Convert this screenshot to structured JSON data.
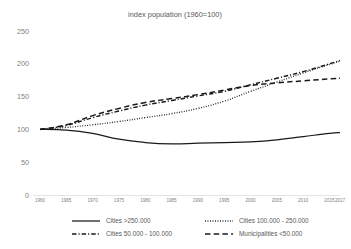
{
  "chart_data": {
    "type": "line",
    "title": "index population (1960=100)",
    "xlabel": "",
    "ylabel": "",
    "ylim": [
      0,
      250
    ],
    "yticks": [
      0,
      50,
      100,
      150,
      200,
      250
    ],
    "xlim": [
      1960,
      2017
    ],
    "xticks": [
      1960,
      1965,
      1970,
      1975,
      1980,
      1985,
      1990,
      1995,
      2000,
      2005,
      2010,
      2015,
      2017
    ],
    "grid": false,
    "legend_position": "bottom",
    "x": [
      1960,
      1965,
      1970,
      1975,
      1980,
      1985,
      1990,
      1995,
      2000,
      2005,
      2010,
      2015,
      2017
    ],
    "series": [
      {
        "name": "Cities >250.000",
        "style": "solid",
        "color": "#1a1a1a",
        "values": [
          100,
          99,
          94,
          85,
          80,
          78,
          79,
          80,
          81,
          84,
          89,
          94,
          95
        ]
      },
      {
        "name": "Cities 100.000 - 250.000",
        "style": "dotted",
        "color": "#1a1a1a",
        "values": [
          100,
          103,
          107,
          112,
          118,
          124,
          132,
          143,
          158,
          172,
          186,
          199,
          204
        ]
      },
      {
        "name": "Cities 50.000 - 100.000",
        "style": "dash-dot",
        "color": "#1a1a1a",
        "values": [
          100,
          106,
          118,
          128,
          137,
          144,
          151,
          158,
          168,
          178,
          188,
          200,
          205
        ]
      },
      {
        "name": "Municipalities <50.000",
        "style": "dashed",
        "color": "#1a1a1a",
        "values": [
          100,
          107,
          121,
          132,
          141,
          147,
          153,
          160,
          167,
          171,
          174,
          177,
          178
        ]
      }
    ]
  },
  "legend": {
    "items": [
      {
        "label": "Cities >250.000",
        "style": "solid"
      },
      {
        "label": "Cities 100.000 - 250.000",
        "style": "dotted"
      },
      {
        "label": "Cities 50.000 - 100.000",
        "style": "dash-dot"
      },
      {
        "label": "Municipalities <50.000",
        "style": "dashed"
      }
    ]
  }
}
